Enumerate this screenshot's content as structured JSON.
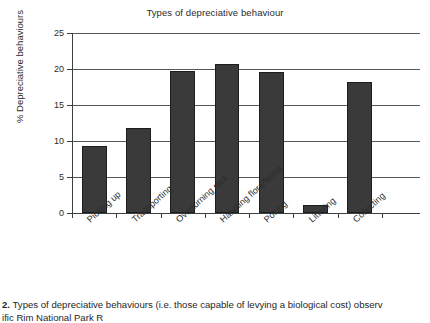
{
  "figure": {
    "caption_number": "2.",
    "caption_line1": "Types of depreciative behaviours (i.e. those capable of levying a biological cost) observ",
    "caption_line2": "ific Rim National Park R"
  },
  "chart_data": {
    "type": "bar",
    "title": "Types of depreciative behaviour",
    "xlabel": "",
    "ylabel": "% Depreciative behaviours",
    "categories": [
      "Picking up",
      "Transporting",
      "Overturning rock",
      "Handling flora/fauna",
      "Poking",
      "Littering",
      "Collecting"
    ],
    "values": [
      9.3,
      11.8,
      19.7,
      20.7,
      19.6,
      1.1,
      18.2
    ],
    "ylim": [
      0,
      25
    ],
    "yticks": [
      0,
      5,
      10,
      15,
      20,
      25
    ],
    "ytick_labels": [
      "0",
      "5",
      "10",
      "15",
      "20",
      "25"
    ],
    "grid": true,
    "legend": "none",
    "bar_color": "#3a3a3a",
    "bar_edge_color": "#1d1d1d",
    "axis_color": "#3c4043",
    "grid_color": "#53585c"
  }
}
